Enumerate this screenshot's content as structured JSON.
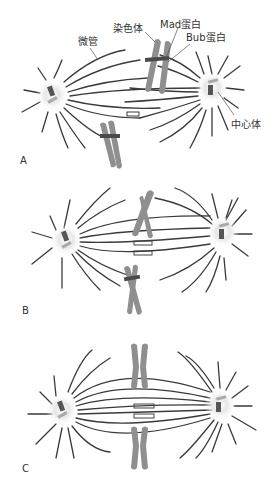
{
  "diagram": {
    "labels": {
      "microtubule": "微管",
      "chromosome": "染色体",
      "mad_protein": "Mad蛋白",
      "bub_protein": "Bub蛋白",
      "centrosome": "中心体"
    },
    "panels": [
      {
        "id": "A",
        "label": "A",
        "description": "Unattached chromosomes with Mad and Bub proteins at kinetochores"
      },
      {
        "id": "B",
        "label": "B",
        "description": "Chromosomes moving toward metaphase plate"
      },
      {
        "id": "C",
        "label": "C",
        "description": "Chromosomes aligned at metaphase plate, bi-oriented"
      }
    ],
    "colors": {
      "microtubule": "#3a3a3a",
      "chromosome": "#8f8f8f",
      "centrosome_halo": "#d9d9d9",
      "kinetochore_protein": "#4a4a4a"
    }
  }
}
